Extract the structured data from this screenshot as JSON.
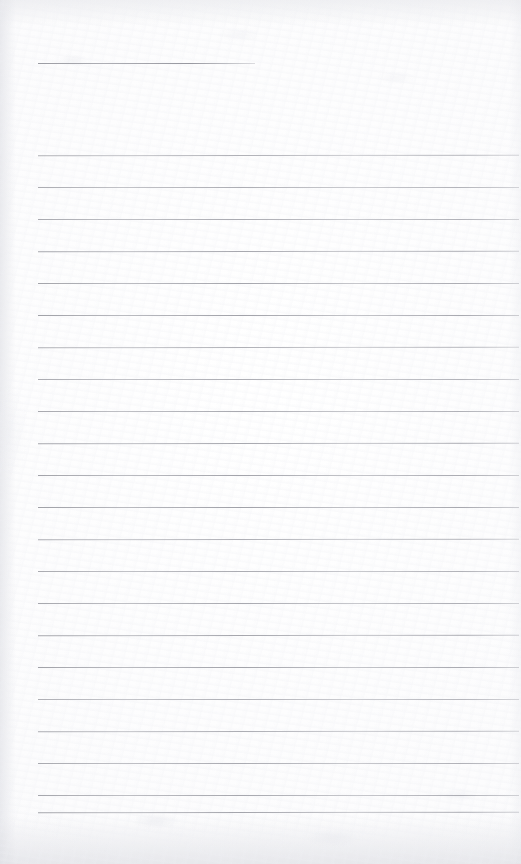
{
  "document": {
    "kind": "scanned-ruled-notebook-page",
    "page_label": "",
    "written_text": "",
    "width_px": 521,
    "height_px": 864,
    "paper_color": "#fdfdfe",
    "rule_color": "#9a9ba2"
  },
  "rules": {
    "header_rule": {
      "name": "header-short-rule",
      "top": 63,
      "left": 38,
      "width": 217
    },
    "body_left": 38,
    "body_width": 481,
    "body_tops": [
      155,
      187,
      219,
      251,
      283,
      315,
      347,
      379,
      411,
      443,
      475,
      507,
      539,
      571,
      603,
      635,
      667,
      699,
      731,
      763,
      795,
      812
    ]
  }
}
